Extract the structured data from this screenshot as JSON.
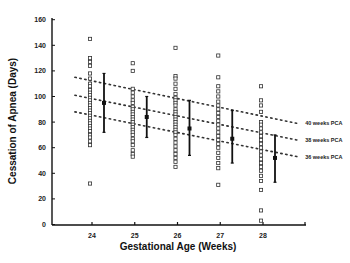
{
  "chart_data": {
    "type": "scatter",
    "title": "",
    "xlabel": "Gestational Age (Weeks)",
    "ylabel": "Cessation of Apnea (Days)",
    "ylim": [
      0,
      160
    ],
    "yticks": [
      0,
      20,
      40,
      60,
      80,
      100,
      120,
      140,
      160
    ],
    "xticks": [
      24,
      25,
      26,
      27,
      28
    ],
    "grid": false,
    "categories": [
      "24",
      "25",
      "26",
      "27",
      "28"
    ],
    "scatter_points": {
      "24": [
        145,
        130,
        127,
        124,
        118,
        114,
        110,
        108,
        105,
        103,
        101,
        99,
        97,
        95,
        93,
        91,
        89,
        87,
        85,
        83,
        81,
        79,
        77,
        75,
        73,
        70,
        68,
        65,
        62,
        32
      ],
      "25": [
        126,
        120,
        106,
        103,
        100,
        97,
        95,
        92,
        90,
        88,
        86,
        84,
        82,
        80,
        78,
        76,
        74,
        72,
        70,
        67,
        65,
        62,
        58,
        55,
        53
      ],
      "26": [
        138,
        116,
        114,
        110,
        106,
        102,
        99,
        97,
        95,
        93,
        90,
        88,
        86,
        84,
        82,
        80,
        78,
        76,
        74,
        72,
        70,
        67,
        64,
        61,
        58,
        55,
        52,
        49,
        45
      ],
      "27": [
        132,
        115,
        108,
        104,
        100,
        96,
        93,
        90,
        87,
        84,
        81,
        78,
        75,
        72,
        69,
        66,
        63,
        60,
        56,
        52,
        48,
        44,
        31
      ],
      "28": [
        108,
        97,
        93,
        88,
        80,
        78,
        75,
        72,
        69,
        66,
        63,
        60,
        57,
        54,
        51,
        48,
        45,
        42,
        38,
        34,
        27,
        11,
        3
      ]
    },
    "series": [
      {
        "name": "Mean",
        "values": [
          95,
          84,
          75,
          67,
          52
        ]
      },
      {
        "name": "Mean + SD",
        "values": [
          118,
          100,
          97,
          89,
          70
        ]
      },
      {
        "name": "Mean - SD",
        "values": [
          72,
          68,
          54,
          48,
          33
        ]
      }
    ],
    "reference_lines": [
      {
        "name": "40 weeks PCA",
        "start": [
          23.6,
          115
        ],
        "end": [
          28.8,
          79
        ]
      },
      {
        "name": "38 weeks PCA",
        "start": [
          23.6,
          101
        ],
        "end": [
          28.8,
          66
        ]
      },
      {
        "name": "36 weeks PCA",
        "start": [
          23.6,
          88
        ],
        "end": [
          28.8,
          53
        ]
      }
    ],
    "legend_position": "right (inline labels)"
  }
}
